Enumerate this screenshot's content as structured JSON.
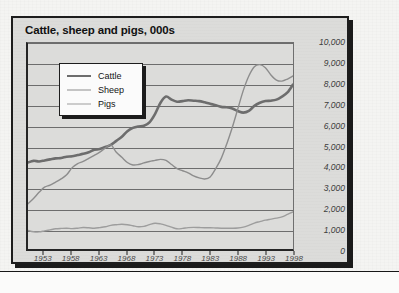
{
  "chart_data": {
    "type": "line",
    "title": "Cattle, sheep and pigs, 000s",
    "xlabel": "",
    "ylabel": "",
    "ylim": [
      0,
      10000
    ],
    "xlim": [
      1950,
      1998
    ],
    "grid": true,
    "legend_position": "inside-top-left",
    "y_ticks": [
      "10,000",
      "9,000",
      "8,000",
      "7,000",
      "6,000",
      "5,000",
      "4,000",
      "3,000",
      "2,000",
      "1,000",
      "0"
    ],
    "y_tick_values": [
      10000,
      9000,
      8000,
      7000,
      6000,
      5000,
      4000,
      3000,
      2000,
      1000,
      0
    ],
    "x_ticks": [
      "1953",
      "1958",
      "1963",
      "1968",
      "1973",
      "1978",
      "1983",
      "1988",
      "1993",
      "1998"
    ],
    "x_tick_values": [
      1953,
      1958,
      1963,
      1968,
      1973,
      1978,
      1983,
      1988,
      1993,
      1998
    ],
    "x": [
      1950,
      1951,
      1952,
      1953,
      1954,
      1955,
      1956,
      1957,
      1958,
      1959,
      1960,
      1961,
      1962,
      1963,
      1964,
      1965,
      1966,
      1967,
      1968,
      1969,
      1970,
      1971,
      1972,
      1973,
      1974,
      1975,
      1976,
      1977,
      1978,
      1979,
      1980,
      1981,
      1982,
      1983,
      1984,
      1985,
      1986,
      1987,
      1988,
      1989,
      1990,
      1991,
      1992,
      1993,
      1994,
      1995,
      1996,
      1997,
      1998
    ],
    "series": [
      {
        "name": "Cattle",
        "color": "#6d6d6d",
        "width": 2.6,
        "values": [
          4200,
          4280,
          4250,
          4300,
          4350,
          4400,
          4420,
          4480,
          4500,
          4560,
          4620,
          4700,
          4820,
          4850,
          4950,
          5050,
          5250,
          5450,
          5720,
          5880,
          5950,
          5980,
          6150,
          6550,
          7100,
          7400,
          7250,
          7150,
          7180,
          7220,
          7200,
          7180,
          7120,
          7050,
          6980,
          6900,
          6880,
          6820,
          6700,
          6620,
          6700,
          6950,
          7100,
          7180,
          7200,
          7250,
          7400,
          7600,
          7980
        ]
      },
      {
        "name": "Sheep",
        "color": "#8d8d8d",
        "width": 1.4,
        "values": [
          2200,
          2450,
          2750,
          3000,
          3100,
          3250,
          3400,
          3600,
          3950,
          4150,
          4250,
          4400,
          4550,
          4700,
          4900,
          5050,
          4700,
          4450,
          4200,
          4080,
          4100,
          4180,
          4250,
          4300,
          4350,
          4300,
          4100,
          3900,
          3800,
          3700,
          3550,
          3450,
          3400,
          3500,
          3900,
          4400,
          5100,
          5900,
          6800,
          7700,
          8400,
          8850,
          8950,
          8800,
          8450,
          8200,
          8150,
          8250,
          8400
        ]
      },
      {
        "name": "Pigs",
        "color": "#9d9d9d",
        "width": 1.4,
        "values": [
          900,
          840,
          830,
          880,
          930,
          980,
          1000,
          1010,
          990,
          1010,
          1040,
          1030,
          1010,
          1040,
          1080,
          1150,
          1180,
          1200,
          1180,
          1130,
          1080,
          1100,
          1180,
          1250,
          1220,
          1150,
          1060,
          980,
          1000,
          1040,
          1050,
          1040,
          1030,
          1030,
          1020,
          1010,
          1010,
          1010,
          1020,
          1060,
          1150,
          1260,
          1330,
          1400,
          1450,
          1500,
          1560,
          1680,
          1800
        ]
      }
    ]
  },
  "legend": {
    "items": [
      {
        "label": "Cattle"
      },
      {
        "label": "Sheep"
      },
      {
        "label": "Pigs"
      }
    ]
  }
}
